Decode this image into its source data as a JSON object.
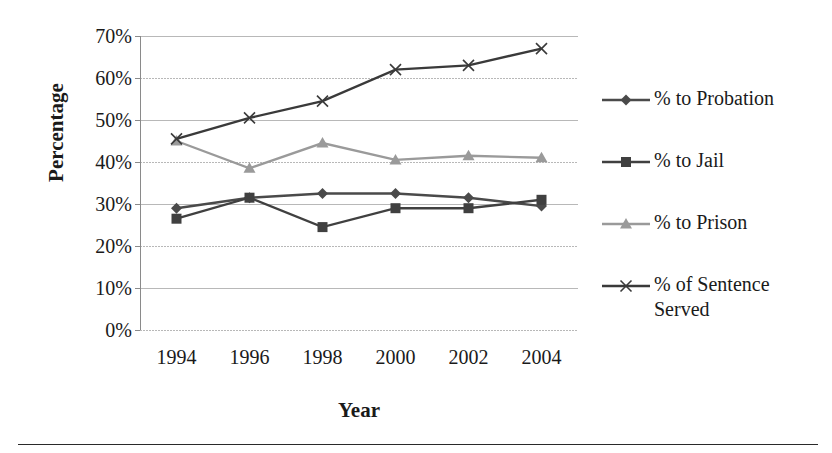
{
  "chart_data": {
    "type": "line",
    "title": "",
    "xlabel": "Year",
    "ylabel": "Percentage",
    "categories": [
      "1994",
      "1996",
      "1998",
      "2000",
      "2002",
      "2004"
    ],
    "x": [
      1994,
      1996,
      1998,
      2000,
      2002,
      2004
    ],
    "ylim": [
      0,
      70
    ],
    "yticks": [
      "0%",
      "10%",
      "20%",
      "30%",
      "40%",
      "50%",
      "60%",
      "70%"
    ],
    "ytick_values": [
      0,
      10,
      20,
      30,
      40,
      50,
      60,
      70
    ],
    "grid": true,
    "legend_position": "right",
    "series": [
      {
        "name": "% to Probation",
        "marker": "diamond",
        "color": "#4a4a4a",
        "values": [
          29,
          31.5,
          32.5,
          32.5,
          31.5,
          29.5
        ]
      },
      {
        "name": "% to Jail",
        "marker": "square",
        "color": "#404040",
        "values": [
          26.5,
          31.5,
          24.5,
          29,
          29,
          31
        ]
      },
      {
        "name": "% to Prison",
        "marker": "triangle",
        "color": "#9a9a9a",
        "values": [
          45,
          38.5,
          44.5,
          40.5,
          41.5,
          41
        ]
      },
      {
        "name": "% of Sentence Served",
        "marker": "x",
        "color": "#3a3a3a",
        "values": [
          45.5,
          50.5,
          54.5,
          62,
          63,
          67
        ]
      }
    ]
  },
  "axes": {
    "y_title": "Percentage",
    "x_title": "Year"
  },
  "legend": {
    "items": [
      {
        "label": "% to Probation"
      },
      {
        "label": "% to Jail"
      },
      {
        "label": "% to Prison"
      },
      {
        "label": "% of Sentence\nServed"
      }
    ]
  },
  "colors": {
    "probation": "#4a4a4a",
    "jail": "#404040",
    "prison": "#9a9a9a",
    "sentence": "#3a3a3a",
    "grid": "#b8b8b8",
    "axis": "#8a8a8a",
    "text": "#1a1a1a"
  }
}
